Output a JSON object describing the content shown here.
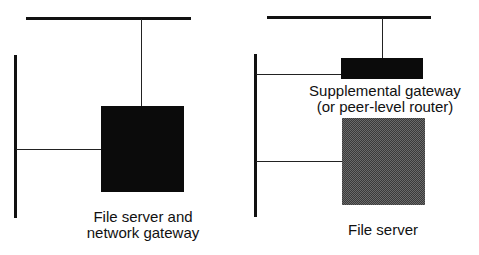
{
  "diagram": {
    "left": {
      "label_line1": "File server and",
      "label_line2": "network gateway"
    },
    "right": {
      "gateway_label_line1": "Supplemental gateway",
      "gateway_label_line2": "(or peer-level router)",
      "server_label": "File server"
    },
    "colors": {
      "network_line": "#111111",
      "solid_box": "#0b0b0b",
      "hatched_box": "#555555"
    }
  }
}
